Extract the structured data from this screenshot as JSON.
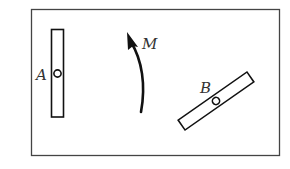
{
  "diagram": {
    "frame": {
      "x": 31,
      "y": 9,
      "width": 248,
      "height": 146,
      "stroke": "#444444"
    },
    "bar_a": {
      "label": "A",
      "x": 51,
      "y": 29,
      "width": 12,
      "height": 88,
      "pivot": {
        "cx": 57,
        "cy": 73,
        "r": 3.5
      }
    },
    "bar_b": {
      "label": "B",
      "cx": 216,
      "cy": 101,
      "length": 84,
      "width": 12,
      "angle": -35,
      "pivot_r": 3.5
    },
    "moment": {
      "label": "M",
      "direction": "counterclockwise-upward"
    },
    "colors": {
      "line": "#111111",
      "label": "#333333",
      "background": "#ffffff"
    }
  }
}
